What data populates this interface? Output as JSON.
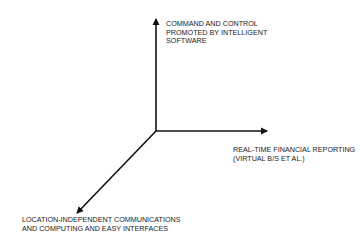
{
  "diagram": {
    "type": "three-axis",
    "colors": {
      "axis": "#111111",
      "text": "#1a1a1a",
      "background": "#ffffff"
    },
    "origin": {
      "x": 156,
      "y": 131
    },
    "axes": [
      {
        "id": "vertical",
        "direction": "up",
        "label_lines": [
          "COMMAND AND CONTROL",
          "PROMOTED BY INTELLIGENT",
          "SOFTWARE"
        ]
      },
      {
        "id": "horizontal",
        "direction": "right",
        "label_lines": [
          "REAL-TIME FINANCIAL REPORTING",
          "(VIRTUAL B/S ET AL.)"
        ]
      },
      {
        "id": "diagonal",
        "direction": "down-left",
        "label_lines": [
          "LOCATION-INDEPENDENT COMMUNICATIONS",
          "AND COMPUTING AND EASY INTERFACES"
        ]
      }
    ]
  }
}
